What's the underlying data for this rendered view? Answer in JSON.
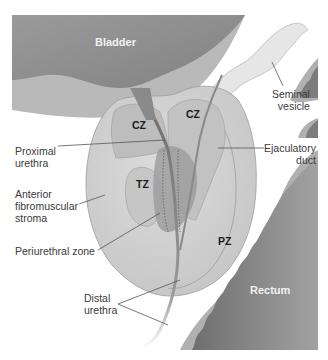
{
  "diagram": {
    "colors": {
      "background": "#ffffff",
      "bladder": "#8e8e8e",
      "bladder_wall": "#b9b9b9",
      "backdrop": "#a8a8a8",
      "prostate": "#d2d2d2",
      "central_zone": "#bdbdbd",
      "transition_zone": "#c6c6c6",
      "periurethral": "#9d9d9d",
      "rectum": "#7c7c7c",
      "rectum_wall": "#b0b0b0",
      "seminal_vesicle": "#e6e6e6",
      "text_dark": "#3a3a3a",
      "text_light": "#f2f2f2",
      "leader_line": "#555555"
    }
  },
  "organs": {
    "bladder": "Bladder",
    "rectum": "Rectum"
  },
  "zones": {
    "cz_left": "CZ",
    "cz_right": "CZ",
    "tz": "TZ",
    "pz": "PZ"
  },
  "labels": {
    "seminal_vesicle": [
      "Seminal",
      "vesicle"
    ],
    "proximal_urethra": [
      "Proximal",
      "urethra"
    ],
    "ejaculatory_duct": [
      "Ejaculatory",
      "duct"
    ],
    "anterior_fibromuscular_stroma": [
      "Anterior",
      "fibromuscular",
      "stroma"
    ],
    "periurethral_zone": [
      "Periurethral zone"
    ],
    "distal_urethra": [
      "Distal",
      "urethra"
    ]
  }
}
